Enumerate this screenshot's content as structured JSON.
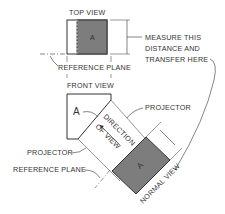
{
  "diagram": {
    "colors": {
      "line": "#3a3a3a",
      "face": "#7d7d7d",
      "background": "#ffffff"
    },
    "labels": {
      "top_view": "TOP VIEW",
      "face_letter": "A",
      "measure_1": "MEASURE THIS",
      "measure_2": "DISTANCE AND",
      "measure_3": "TRANSFER HERE",
      "reference_plane_top": "REFERENCE PLANE",
      "front_view": "FRONT VIEW",
      "front_a": "A",
      "projector_right": "PROJECTOR",
      "direction": "DIRECTION",
      "of_view": "OF VIEW",
      "projector_left": "PROJECTOR",
      "reference_plane_bottom": "REFERENCE PLANE",
      "normal_view": "NORMAL VIEW"
    }
  }
}
